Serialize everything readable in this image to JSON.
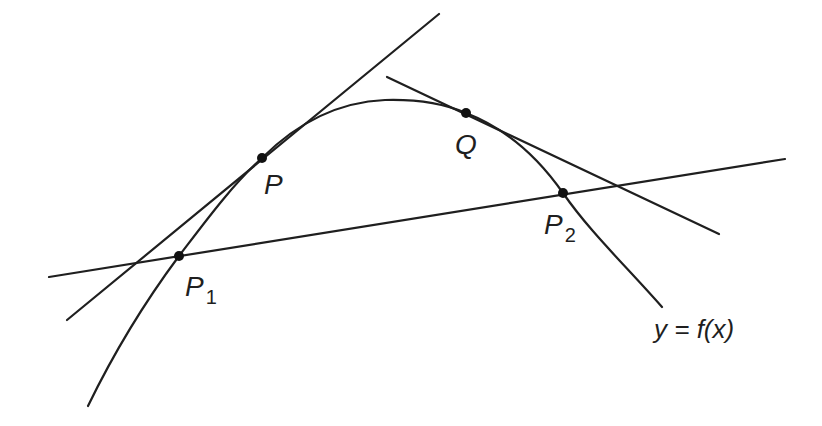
{
  "diagram": {
    "stroke_color": "#1f1f1f",
    "background": "#ffffff",
    "curve": {
      "label": "y = f(x)"
    },
    "points": [
      {
        "id": "P",
        "label": "P",
        "subscript": ""
      },
      {
        "id": "Q",
        "label": "Q",
        "subscript": ""
      },
      {
        "id": "P1",
        "label": "P",
        "subscript": "1"
      },
      {
        "id": "P2",
        "label": "P",
        "subscript": "2"
      }
    ],
    "lines": [
      {
        "id": "tangent-P",
        "kind": "tangent",
        "through": [
          "P"
        ]
      },
      {
        "id": "tangent-Q",
        "kind": "tangent",
        "through": [
          "Q"
        ]
      },
      {
        "id": "secant",
        "kind": "secant",
        "through": [
          "P1",
          "P2"
        ]
      }
    ]
  }
}
